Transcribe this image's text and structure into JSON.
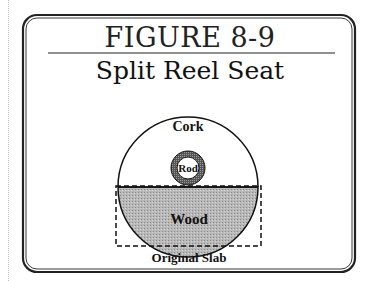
{
  "figure": {
    "number": "FIGURE 8-9",
    "title": "Split Reel Seat"
  },
  "labels": {
    "cork": "Cork",
    "rod": "Rod",
    "wood": "Wood",
    "slab": "Original Slab"
  }
}
